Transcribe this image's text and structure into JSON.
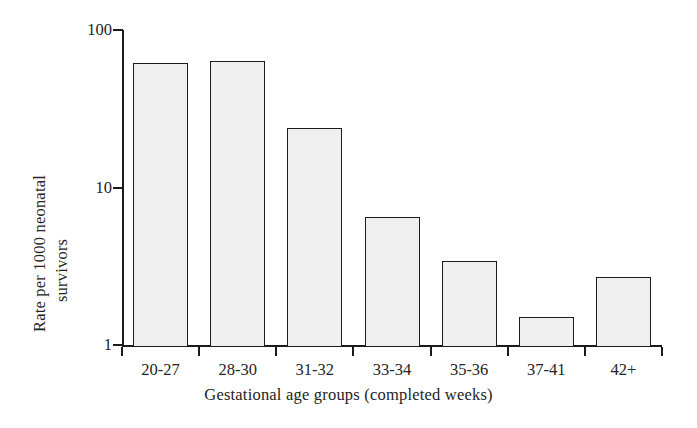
{
  "chart_data": {
    "type": "bar",
    "title": "",
    "subtitle": "",
    "xlabel": "Gestational age groups (completed weeks)",
    "ylabel": "Rate per 1000 neonatal survivors",
    "ylabel_lines": [
      "Rate per 1000 neonatal",
      "survivors"
    ],
    "yscale": "log",
    "ylim": [
      1,
      100
    ],
    "ytick_labels": [
      "100",
      "10",
      "1"
    ],
    "ytick_values": [
      100,
      10,
      1
    ],
    "categories": [
      "20-27",
      "28-30",
      "31-32",
      "33-34",
      "35-36",
      "37-41",
      "42+"
    ],
    "values": [
      62,
      64,
      24,
      6.5,
      3.4,
      1.5,
      2.7
    ],
    "series": [
      {
        "name": "Rate per 1000 neonatal survivors",
        "values": [
          62,
          64,
          24,
          6.5,
          3.4,
          1.5,
          2.7
        ]
      }
    ],
    "grid": false,
    "legend": "none",
    "bar_fill_color": "#efefef",
    "bar_edge_color": "#1b1b1b",
    "axis_color": "#1b1b1b",
    "background_color": "#ffffff"
  }
}
